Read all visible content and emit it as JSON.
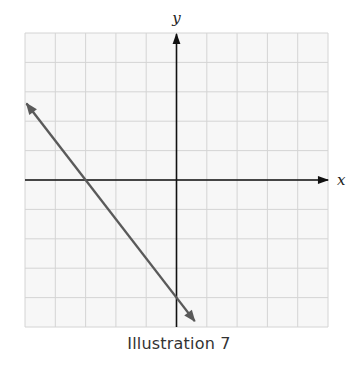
{
  "caption": "Illustration 7",
  "chart_data": {
    "type": "line",
    "title": "",
    "xlabel": "x",
    "ylabel": "y",
    "xlim": [
      -5,
      5
    ],
    "ylim": [
      -5,
      5
    ],
    "grid": true,
    "grid_step": 1,
    "tick_labels": false,
    "series": [
      {
        "name": "line",
        "equation": "y = -4/3 x - 4",
        "x_intercept": -3,
        "y_intercept": -4,
        "slope": -1.3333,
        "x": [
          -4.95,
          0.6
        ],
        "y": [
          2.6,
          -4.8
        ],
        "arrows": "both",
        "color": "#5a5a5a"
      }
    ],
    "colors": {
      "grid": "#d4d4d4",
      "axes": "#111111",
      "background": "#f7f7f7"
    }
  }
}
